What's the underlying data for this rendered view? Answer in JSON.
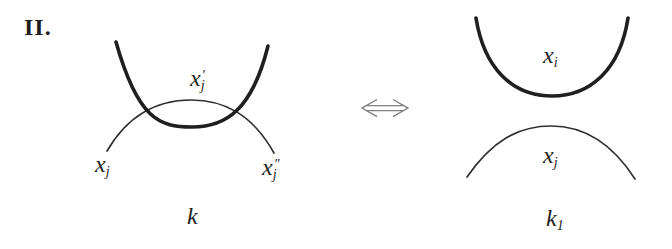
{
  "figure": {
    "case_label": "II.",
    "left_diagram": {
      "over_strand_label": {
        "base": "x",
        "sub": "j",
        "sup": "′"
      },
      "under_strand_left_label": {
        "base": "x",
        "sub": "j",
        "sup": ""
      },
      "under_strand_right_label": {
        "base": "x",
        "sub": "j",
        "sup": "″"
      },
      "caption": {
        "base": "k",
        "sub": "",
        "sup": ""
      }
    },
    "right_diagram": {
      "upper_strand_label": {
        "base": "x",
        "sub": "i",
        "sup": ""
      },
      "lower_strand_label": {
        "base": "x",
        "sub": "j",
        "sup": ""
      },
      "caption": {
        "base": "k",
        "sub": "1",
        "sup": ""
      }
    }
  },
  "icons": {
    "equivalence_arrow": "⟺"
  },
  "colors": {
    "background": "#ffffff",
    "ink": "#1f1f1f",
    "thin": "#303030",
    "arrow": "#808080",
    "label": "#1e1e1e"
  }
}
